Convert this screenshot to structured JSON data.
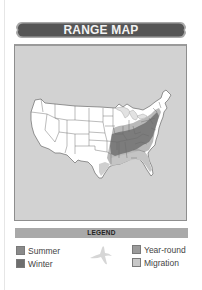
{
  "banner": {
    "title": "RANGE MAP",
    "fill_color": "#555555",
    "border_color": "#a0a0a0"
  },
  "map": {
    "background_color": "#d2d2d2",
    "land_color": "#ffffff",
    "state_line_color": "#6a6a6a",
    "region": "Contiguous United States",
    "highlighted_range": "Eastern United States (east of the Great Plains, south of the Great Lakes to the Gulf Coast and Atlantic seaboard)"
  },
  "legend": {
    "title": "LEGEND",
    "bar_color": "#a9a9a9",
    "items": [
      {
        "label": "Summer",
        "color": "#8a8a8a",
        "icon": "summer-swatch"
      },
      {
        "label": "Winter",
        "color": "#6e6e6e",
        "icon": "winter-swatch"
      },
      {
        "label": "Year-round",
        "color": "#9b9b9b",
        "icon": "year-round-swatch"
      },
      {
        "label": "Migration",
        "color": "#c8c8c8",
        "icon": "migration-swatch"
      }
    ],
    "decoration": "bird-silhouette-icon"
  }
}
